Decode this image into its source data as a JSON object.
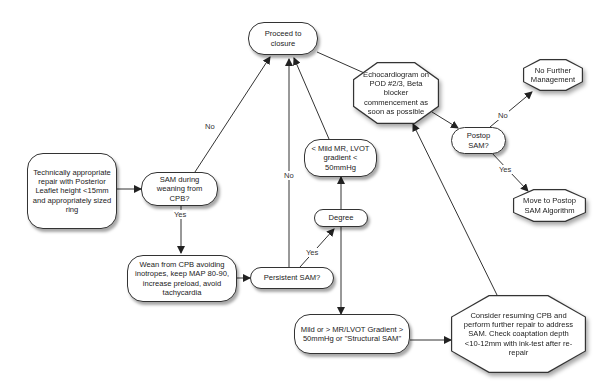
{
  "nodes": {
    "start": "Technically appropriate repair with Posterior Leaflet height <15mm and appropriately sized ring",
    "sam_weaning": "SAM during weaning from CPB?",
    "wean_cpb": "Wean from CPB avoiding inotropes, keep MAP 80-90, increase preload, avoid tachycardia",
    "persistent_sam": "Persistent SAM?",
    "proceed_closure": "Proceed to closure",
    "degree": "Degree",
    "mild_mr": "< Mild MR, LVOT gradient < 50mmHg",
    "severe": "Mild or > MR/LVOT Gradient > 50mmHg or \"Structural SAM\"",
    "echo": "Echocardiogram on POD #2/3, Beta blocker commencement as soon as possible",
    "postop_sam": "Postop SAM?",
    "no_further": "No Further Management",
    "move_postop": "Move to Postop SAM Algorithm",
    "resume_cpb": "Consider resuming CPB and perform further repair to address SAM. Check coaptation depth <10-12mm with ink-test after re-repair"
  },
  "edge_labels": {
    "sam_no": "No",
    "sam_yes": "Yes",
    "persistent_no": "No",
    "persistent_yes": "Yes",
    "postop_no": "No",
    "postop_yes": "Yes"
  },
  "colors": {
    "stroke": "#333333",
    "fill": "#ffffff",
    "text": "#222222"
  }
}
